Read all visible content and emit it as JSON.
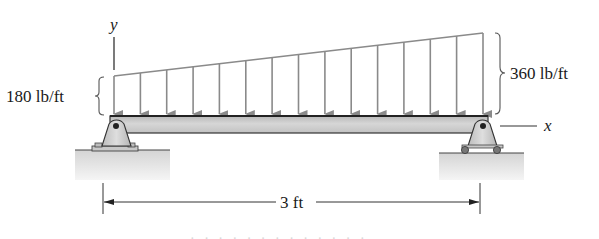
{
  "diagram": {
    "type": "beam-with-linearly-varying-distributed-load",
    "labels": {
      "y_axis": "y",
      "x_axis": "x",
      "left_intensity": "180 lb/ft",
      "right_intensity": "360 lb/ft",
      "span": "3 ft"
    },
    "load": {
      "w_start": 180,
      "w_end": 360,
      "unit": "lb/ft",
      "arrow_count": 15,
      "arrow_color": "#8a8a8a"
    },
    "beam": {
      "length": 3,
      "length_unit": "ft",
      "fill_color": "#c9c9c9",
      "edge_color": "#333333"
    },
    "supports": {
      "left": "pin",
      "right": "roller"
    },
    "ground_color": "#dcdcdc",
    "footer_text_clipped": "· ·   · · · · · · · · · · ·"
  }
}
